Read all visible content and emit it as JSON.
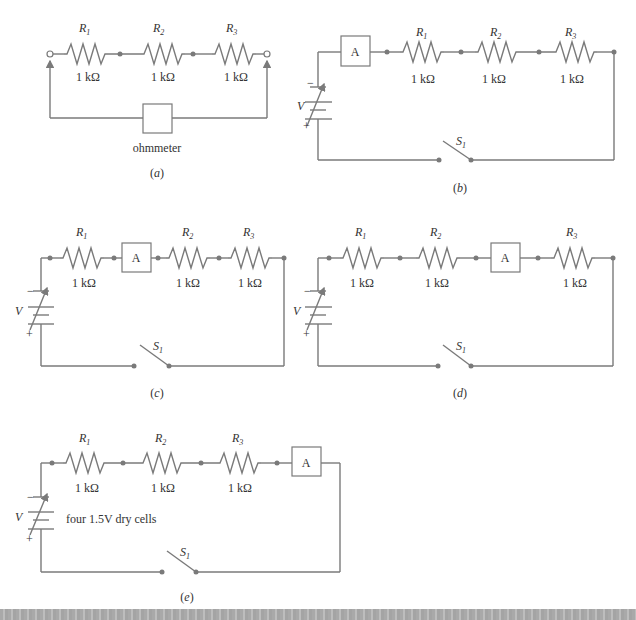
{
  "figure": {
    "panels": [
      {
        "id": "a",
        "caption": "(a)",
        "components": [
          "R1",
          "R2",
          "R3"
        ],
        "resistors": [
          {
            "name": "R",
            "sub": "1",
            "value": "1 kΩ"
          },
          {
            "name": "R",
            "sub": "2",
            "value": "1 kΩ"
          },
          {
            "name": "R",
            "sub": "3",
            "value": "1 kΩ"
          }
        ],
        "meter_label": "ohmmeter"
      },
      {
        "id": "b",
        "caption": "(b)",
        "series_order": [
          "A",
          "R1",
          "R2",
          "R3"
        ],
        "ammeter_label": "A",
        "resistors": [
          {
            "name": "R",
            "sub": "1",
            "value": "1 kΩ"
          },
          {
            "name": "R",
            "sub": "2",
            "value": "1 kΩ"
          },
          {
            "name": "R",
            "sub": "3",
            "value": "1 kΩ"
          }
        ],
        "source": {
          "label": "V",
          "minus": "−",
          "plus": "+"
        },
        "switch": {
          "name": "S",
          "sub": "1"
        }
      },
      {
        "id": "c",
        "caption": "(c)",
        "series_order": [
          "R1",
          "A",
          "R2",
          "R3"
        ],
        "ammeter_label": "A",
        "resistors": [
          {
            "name": "R",
            "sub": "1",
            "value": "1 kΩ"
          },
          {
            "name": "R",
            "sub": "2",
            "value": "1 kΩ"
          },
          {
            "name": "R",
            "sub": "3",
            "value": "1 kΩ"
          }
        ],
        "source": {
          "label": "V",
          "minus": "−",
          "plus": "+"
        },
        "switch": {
          "name": "S",
          "sub": "1"
        }
      },
      {
        "id": "d",
        "caption": "(d)",
        "series_order": [
          "R1",
          "R2",
          "A",
          "R3"
        ],
        "ammeter_label": "A",
        "resistors": [
          {
            "name": "R",
            "sub": "1",
            "value": "1 kΩ"
          },
          {
            "name": "R",
            "sub": "2",
            "value": "1 kΩ"
          },
          {
            "name": "R",
            "sub": "3",
            "value": "1 kΩ"
          }
        ],
        "source": {
          "label": "V",
          "minus": "−",
          "plus": "+"
        },
        "switch": {
          "name": "S",
          "sub": "1"
        }
      },
      {
        "id": "e",
        "caption": "(e)",
        "series_order": [
          "R1",
          "R2",
          "R3",
          "A"
        ],
        "ammeter_label": "A",
        "resistors": [
          {
            "name": "R",
            "sub": "1",
            "value": "1 kΩ"
          },
          {
            "name": "R",
            "sub": "2",
            "value": "1 kΩ"
          },
          {
            "name": "R",
            "sub": "3",
            "value": "1 kΩ"
          }
        ],
        "source": {
          "label": "V",
          "minus": "−",
          "plus": "+",
          "note": "four 1.5V dry cells"
        },
        "switch": {
          "name": "S",
          "sub": "1"
        }
      }
    ]
  }
}
